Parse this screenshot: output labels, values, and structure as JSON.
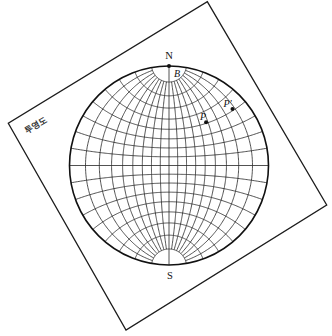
{
  "overlay": {
    "label": "투영도"
  },
  "net": {
    "projection": "stereographic",
    "grid_interval_deg": 10,
    "polar_cutoff_deg": 80,
    "north_label": "N",
    "south_label": "S"
  },
  "points": [
    {
      "id": "B",
      "label": "B",
      "lon": 0,
      "lat": 90
    },
    {
      "id": "P",
      "label": "P",
      "lon": 48,
      "lat": 41
    },
    {
      "id": "P_prime",
      "label": "P'",
      "lon": 78,
      "lat": 41
    }
  ]
}
